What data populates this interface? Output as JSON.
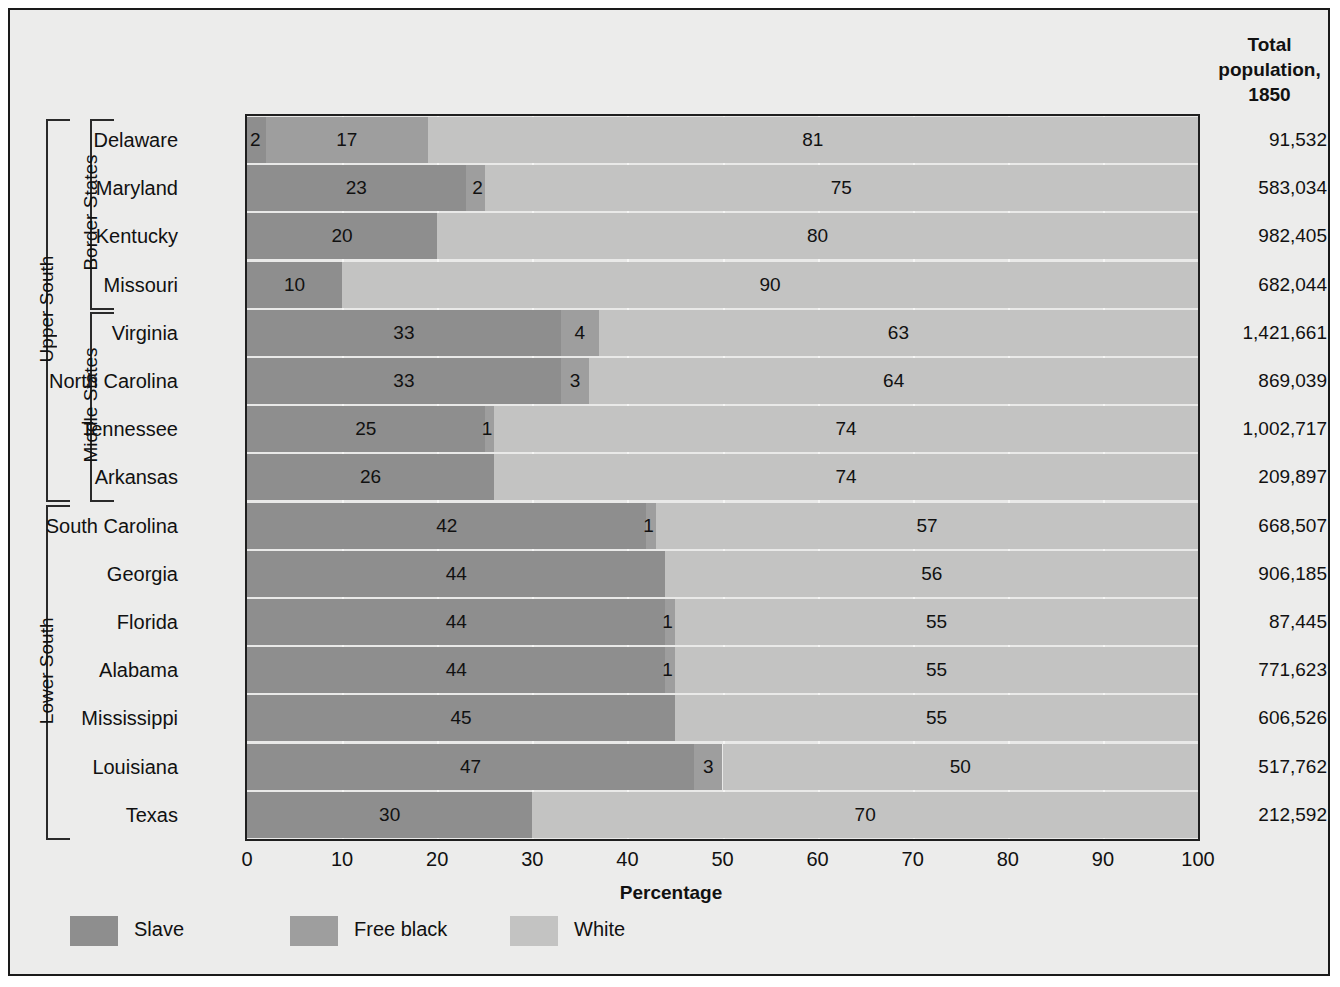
{
  "header": {
    "total_population_label": "Total\npopulation,\n1850"
  },
  "axis": {
    "xlabel": "Percentage",
    "ticks": [
      "0",
      "10",
      "20",
      "30",
      "40",
      "50",
      "60",
      "70",
      "80",
      "90",
      "100"
    ]
  },
  "legend": [
    {
      "name": "Slave",
      "color": "#8e8e8e"
    },
    {
      "name": "Free black",
      "color": "#9e9e9e"
    },
    {
      "name": "White",
      "color": "#c3c3c2"
    }
  ],
  "groups": [
    {
      "label": "Upper South",
      "level": 0,
      "first": 0,
      "last": 7
    },
    {
      "label": "Border States",
      "level": 1,
      "first": 0,
      "last": 3
    },
    {
      "label": "Middle States",
      "level": 1,
      "first": 4,
      "last": 7
    },
    {
      "label": "Lower South",
      "level": 0,
      "first": 8,
      "last": 14
    }
  ],
  "chart_data": {
    "type": "bar",
    "title": "",
    "subtitle": "",
    "xlabel": "Percentage",
    "ylabel": "",
    "xlim": [
      0,
      100
    ],
    "grid": true,
    "orientation": "horizontal",
    "stacked": true,
    "legend_position": "bottom-left",
    "legend": [
      "Slave",
      "Free black",
      "White"
    ],
    "categories": [
      "Delaware",
      "Maryland",
      "Kentucky",
      "Missouri",
      "Virginia",
      "North Carolina",
      "Tennessee",
      "Arkansas",
      "South Carolina",
      "Georgia",
      "Florida",
      "Alabama",
      "Mississippi",
      "Louisiana",
      "Texas"
    ],
    "series": [
      {
        "name": "Slave",
        "values": [
          2,
          23,
          20,
          10,
          33,
          33,
          25,
          26,
          42,
          44,
          44,
          44,
          45,
          47,
          30
        ]
      },
      {
        "name": "Free black",
        "values": [
          17,
          2,
          0,
          0,
          4,
          3,
          1,
          0,
          1,
          0,
          1,
          1,
          0,
          3,
          0
        ]
      },
      {
        "name": "White",
        "values": [
          81,
          75,
          80,
          90,
          63,
          64,
          74,
          74,
          57,
          56,
          55,
          55,
          55,
          50,
          70
        ]
      }
    ],
    "extra_column": {
      "header": "Total population, 1850",
      "values": [
        "91,532",
        "583,034",
        "982,405",
        "682,044",
        "1,421,661",
        "869,039",
        "1,002,717",
        "209,897",
        "668,507",
        "906,185",
        "87,445",
        "771,623",
        "606,526",
        "517,762",
        "212,592"
      ]
    }
  },
  "rows": [
    {
      "state": "Delaware",
      "slave": 2,
      "free": 17,
      "white": 81,
      "pop": "91,532"
    },
    {
      "state": "Maryland",
      "slave": 23,
      "free": 2,
      "white": 75,
      "pop": "583,034"
    },
    {
      "state": "Kentucky",
      "slave": 20,
      "free": 0,
      "white": 80,
      "pop": "982,405"
    },
    {
      "state": "Missouri",
      "slave": 10,
      "free": 0,
      "white": 90,
      "pop": "682,044"
    },
    {
      "state": "Virginia",
      "slave": 33,
      "free": 4,
      "white": 63,
      "pop": "1,421,661"
    },
    {
      "state": "North Carolina",
      "slave": 33,
      "free": 3,
      "white": 64,
      "pop": "869,039"
    },
    {
      "state": "Tennessee",
      "slave": 25,
      "free": 1,
      "white": 74,
      "pop": "1,002,717"
    },
    {
      "state": "Arkansas",
      "slave": 26,
      "free": 0,
      "white": 74,
      "pop": "209,897"
    },
    {
      "state": "South Carolina",
      "slave": 42,
      "free": 1,
      "white": 57,
      "pop": "668,507"
    },
    {
      "state": "Georgia",
      "slave": 44,
      "free": 0,
      "white": 56,
      "pop": "906,185"
    },
    {
      "state": "Florida",
      "slave": 44,
      "free": 1,
      "white": 55,
      "pop": "87,445"
    },
    {
      "state": "Alabama",
      "slave": 44,
      "free": 1,
      "white": 55,
      "pop": "771,623"
    },
    {
      "state": "Mississippi",
      "slave": 45,
      "free": 0,
      "white": 55,
      "pop": "606,526"
    },
    {
      "state": "Louisiana",
      "slave": 47,
      "free": 3,
      "white": 50,
      "pop": "517,762"
    },
    {
      "state": "Texas",
      "slave": 30,
      "free": 0,
      "white": 70,
      "pop": "212,592"
    }
  ]
}
